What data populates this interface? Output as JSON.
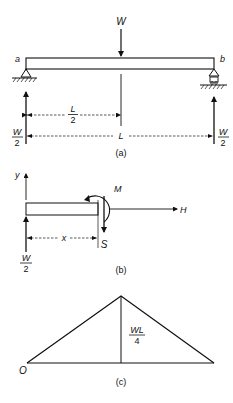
{
  "figure_a": {
    "load_label": "W",
    "left_end_label": "a",
    "right_end_label": "b",
    "half_span_label_num": "L",
    "half_span_label_den": "2",
    "span_label": "L",
    "left_reaction_num": "W",
    "left_reaction_den": "2",
    "right_reaction_num": "W",
    "right_reaction_den": "2",
    "caption": "(a)"
  },
  "figure_b": {
    "y_axis_label": "y",
    "moment_label": "M",
    "axial_label": "H",
    "shear_label": "S",
    "distance_label": "x",
    "reaction_num": "W",
    "reaction_den": "2",
    "caption": "(b)"
  },
  "figure_c": {
    "origin_label": "O",
    "peak_label_num": "WL",
    "peak_label_den": "4",
    "caption": "(c)"
  },
  "colors": {
    "ink": "#111111",
    "background": "#ffffff"
  }
}
